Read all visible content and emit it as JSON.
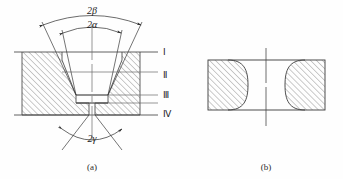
{
  "figure": {
    "title": "",
    "background_color": "#fefefe",
    "line_color": "#3a3a3a",
    "hatch_color": "#555555",
    "text_color": "#1a1a1a"
  },
  "panel_a": {
    "caption": "(a)",
    "angle_labels": {
      "outer_top": "2β",
      "inner_top": "2α",
      "bottom": "2γ"
    },
    "zone_labels": [
      "Ⅰ",
      "Ⅱ",
      "Ⅲ",
      "Ⅳ"
    ]
  },
  "panel_b": {
    "caption": "(b)"
  }
}
